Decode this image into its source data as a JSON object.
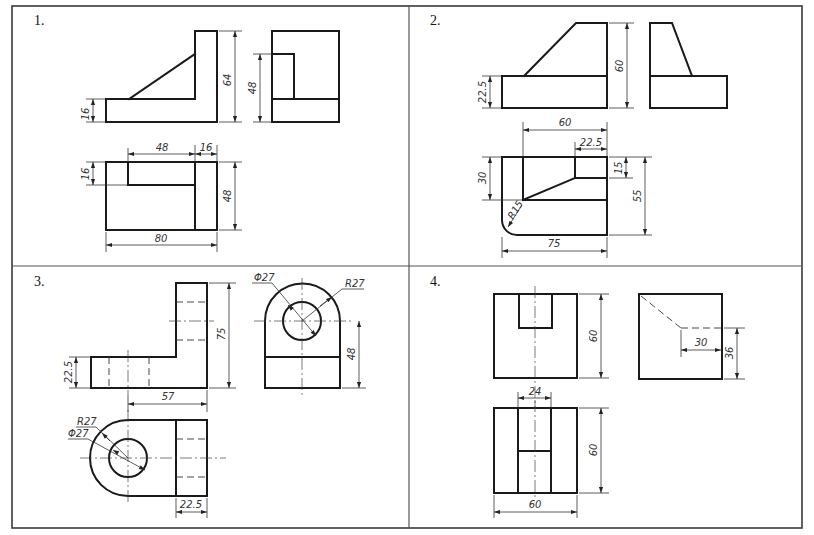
{
  "sheet": {
    "title": "Three-view orthographic drawing exercises",
    "problems": [
      {
        "number_label": "1.",
        "dimensions": {
          "front_height": "64",
          "base_height": "16",
          "side_height": "48",
          "top_notch_width": "48",
          "top_wall_width": "16",
          "top_notch_depth": "16",
          "top_depth": "48",
          "overall_width": "80"
        }
      },
      {
        "number_label": "2.",
        "dimensions": {
          "front_height": "60",
          "base_height": "22.5",
          "top_inner_width": "60",
          "top_step_width": "22.5",
          "top_step_depth": "15",
          "top_depth": "55",
          "top_inner_depth": "30",
          "fillet_radius": "R15",
          "overall_width": "75"
        }
      },
      {
        "number_label": "3.",
        "dimensions": {
          "front_height": "75",
          "base_height": "22.5",
          "hole_to_wall": "57",
          "hole_diameter_side": "Φ27",
          "arc_radius_side": "R27",
          "center_height": "48",
          "arc_radius_top": "R27",
          "hole_diameter_top": "Φ27",
          "wall_thickness": "22.5"
        }
      },
      {
        "number_label": "4.",
        "dimensions": {
          "front_height": "60",
          "side_slot_width": "30",
          "side_slot_height": "36",
          "slot_width": "24",
          "top_depth": "60",
          "overall_width": "60"
        }
      }
    ]
  },
  "colors": {
    "line": "#1a1a1a",
    "frame": "#3a3a3a",
    "background": "#ffffff"
  }
}
